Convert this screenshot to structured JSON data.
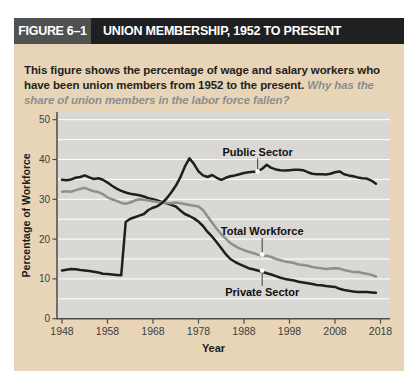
{
  "figure": {
    "label": "FIGURE 6–1",
    "title": "UNION MEMBERSHIP, 1952 TO PRESENT"
  },
  "caption": {
    "text": "This figure shows the percentage of wage and salary workers who have been union members from 1952 to the present.",
    "question": "Why has the share of union members in the labor force fallen?"
  },
  "colors": {
    "card_bg": "#e8d5b7",
    "header_label_bg": "#505153",
    "header_title_bg": "#202022",
    "header_text": "#ffffff",
    "panel_bg": "#d9d8d5",
    "gridline": "#ffffff",
    "axis": "#4b4c4e",
    "tick_label": "#3d3d3d",
    "axis_title": "#1c1c1c",
    "caption_text": "#231f20",
    "caption_question": "#8a8e90",
    "series_dark": "#1f1f20",
    "series_gray": "#8f8f8d",
    "annotation_text": "#101010",
    "leader": "#3a3a3a",
    "dot_fill": "#ffffff"
  },
  "chart_data": {
    "type": "line",
    "xlabel": "Year",
    "ylabel": "Percentage of Workforce",
    "xlim": [
      1947,
      2019
    ],
    "ylim": [
      0,
      50
    ],
    "x_ticks": [
      1948,
      1958,
      1968,
      1978,
      1988,
      1998,
      2008,
      2018
    ],
    "y_ticks": [
      0,
      10,
      20,
      30,
      40,
      50
    ],
    "grid_step": 5,
    "grid": "horizontal-white",
    "legend": "inline-labels",
    "series": [
      {
        "name": "Public Sector",
        "color_key": "series_dark",
        "points": [
          [
            1948,
            12.1
          ],
          [
            1949,
            12.3
          ],
          [
            1950,
            12.5
          ],
          [
            1951,
            12.4
          ],
          [
            1952,
            12.2
          ],
          [
            1953,
            12.1
          ],
          [
            1954,
            12.0
          ],
          [
            1955,
            11.8
          ],
          [
            1956,
            11.6
          ],
          [
            1957,
            11.3
          ],
          [
            1958,
            11.2
          ],
          [
            1959,
            11.1
          ],
          [
            1960,
            11.0
          ],
          [
            1961,
            10.9
          ],
          [
            1962,
            24.3
          ],
          [
            1963,
            25.1
          ],
          [
            1964,
            25.5
          ],
          [
            1965,
            25.9
          ],
          [
            1966,
            26.3
          ],
          [
            1967,
            27.3
          ],
          [
            1968,
            27.9
          ],
          [
            1969,
            28.3
          ],
          [
            1970,
            29.1
          ],
          [
            1971,
            30.2
          ],
          [
            1972,
            31.7
          ],
          [
            1973,
            33.4
          ],
          [
            1974,
            35.5
          ],
          [
            1975,
            38.2
          ],
          [
            1976,
            40.3
          ],
          [
            1977,
            38.9
          ],
          [
            1978,
            37.0
          ],
          [
            1979,
            36.0
          ],
          [
            1980,
            35.6
          ],
          [
            1981,
            36.1
          ],
          [
            1982,
            35.4
          ],
          [
            1983,
            34.9
          ],
          [
            1984,
            35.4
          ],
          [
            1985,
            35.8
          ],
          [
            1986,
            36.0
          ],
          [
            1987,
            36.3
          ],
          [
            1988,
            36.6
          ],
          [
            1989,
            36.8
          ],
          [
            1990,
            36.9
          ],
          [
            1991,
            37.0
          ],
          [
            1992,
            37.7
          ],
          [
            1993,
            38.7
          ],
          [
            1994,
            37.9
          ],
          [
            1995,
            37.5
          ],
          [
            1996,
            37.3
          ],
          [
            1997,
            37.2
          ],
          [
            1998,
            37.3
          ],
          [
            1999,
            37.4
          ],
          [
            2000,
            37.4
          ],
          [
            2001,
            37.3
          ],
          [
            2002,
            36.8
          ],
          [
            2003,
            36.4
          ],
          [
            2004,
            36.3
          ],
          [
            2005,
            36.3
          ],
          [
            2006,
            36.2
          ],
          [
            2007,
            36.4
          ],
          [
            2008,
            36.8
          ],
          [
            2009,
            37.0
          ],
          [
            2010,
            36.3
          ],
          [
            2011,
            36.0
          ],
          [
            2012,
            35.8
          ],
          [
            2013,
            35.5
          ],
          [
            2014,
            35.3
          ],
          [
            2015,
            35.2
          ],
          [
            2016,
            34.7
          ],
          [
            2017,
            33.9
          ]
        ]
      },
      {
        "name": "Total Workforce",
        "color_key": "series_gray",
        "points": [
          [
            1948,
            31.9
          ],
          [
            1949,
            32.0
          ],
          [
            1950,
            31.9
          ],
          [
            1951,
            32.3
          ],
          [
            1952,
            32.6
          ],
          [
            1953,
            32.9
          ],
          [
            1954,
            32.4
          ],
          [
            1955,
            32.0
          ],
          [
            1956,
            31.8
          ],
          [
            1957,
            31.3
          ],
          [
            1958,
            30.5
          ],
          [
            1959,
            30.0
          ],
          [
            1960,
            29.6
          ],
          [
            1961,
            29.1
          ],
          [
            1962,
            28.9
          ],
          [
            1963,
            29.2
          ],
          [
            1964,
            29.7
          ],
          [
            1965,
            30.0
          ],
          [
            1966,
            29.9
          ],
          [
            1967,
            29.7
          ],
          [
            1968,
            29.5
          ],
          [
            1969,
            29.3
          ],
          [
            1970,
            29.2
          ],
          [
            1971,
            29.1
          ],
          [
            1972,
            29.0
          ],
          [
            1973,
            29.2
          ],
          [
            1974,
            29.0
          ],
          [
            1975,
            28.8
          ],
          [
            1976,
            28.6
          ],
          [
            1977,
            28.4
          ],
          [
            1978,
            28.2
          ],
          [
            1979,
            27.3
          ],
          [
            1980,
            25.7
          ],
          [
            1981,
            24.1
          ],
          [
            1982,
            22.6
          ],
          [
            1983,
            21.2
          ],
          [
            1984,
            20.1
          ],
          [
            1985,
            19.0
          ],
          [
            1986,
            18.3
          ],
          [
            1987,
            17.7
          ],
          [
            1988,
            17.2
          ],
          [
            1989,
            16.8
          ],
          [
            1990,
            16.5
          ],
          [
            1991,
            16.1
          ],
          [
            1992,
            15.8
          ],
          [
            1993,
            15.8
          ],
          [
            1994,
            15.5
          ],
          [
            1995,
            15.0
          ],
          [
            1996,
            14.7
          ],
          [
            1997,
            14.4
          ],
          [
            1998,
            14.2
          ],
          [
            1999,
            14.0
          ],
          [
            2000,
            13.6
          ],
          [
            2001,
            13.5
          ],
          [
            2002,
            13.3
          ],
          [
            2003,
            13.0
          ],
          [
            2004,
            12.8
          ],
          [
            2005,
            12.7
          ],
          [
            2006,
            12.5
          ],
          [
            2007,
            12.6
          ],
          [
            2008,
            12.7
          ],
          [
            2009,
            12.6
          ],
          [
            2010,
            12.2
          ],
          [
            2011,
            12.0
          ],
          [
            2012,
            11.7
          ],
          [
            2013,
            11.7
          ],
          [
            2014,
            11.5
          ],
          [
            2015,
            11.3
          ],
          [
            2016,
            11.0
          ],
          [
            2017,
            10.6
          ]
        ]
      },
      {
        "name": "Private Sector",
        "color_key": "series_dark",
        "points": [
          [
            1948,
            34.9
          ],
          [
            1949,
            34.8
          ],
          [
            1950,
            35.0
          ],
          [
            1951,
            35.4
          ],
          [
            1952,
            35.6
          ],
          [
            1953,
            36.0
          ],
          [
            1954,
            35.5
          ],
          [
            1955,
            35.1
          ],
          [
            1956,
            35.3
          ],
          [
            1957,
            34.9
          ],
          [
            1958,
            34.2
          ],
          [
            1959,
            33.4
          ],
          [
            1960,
            32.7
          ],
          [
            1961,
            32.1
          ],
          [
            1962,
            31.7
          ],
          [
            1963,
            31.4
          ],
          [
            1964,
            31.2
          ],
          [
            1965,
            31.0
          ],
          [
            1966,
            30.7
          ],
          [
            1967,
            30.3
          ],
          [
            1968,
            30.0
          ],
          [
            1969,
            29.7
          ],
          [
            1970,
            29.3
          ],
          [
            1971,
            29.0
          ],
          [
            1972,
            28.6
          ],
          [
            1973,
            28.2
          ],
          [
            1974,
            27.2
          ],
          [
            1975,
            26.3
          ],
          [
            1976,
            25.8
          ],
          [
            1977,
            25.2
          ],
          [
            1978,
            24.4
          ],
          [
            1979,
            23.3
          ],
          [
            1980,
            21.8
          ],
          [
            1981,
            20.6
          ],
          [
            1982,
            19.2
          ],
          [
            1983,
            17.7
          ],
          [
            1984,
            16.2
          ],
          [
            1985,
            15.0
          ],
          [
            1986,
            14.3
          ],
          [
            1987,
            13.7
          ],
          [
            1988,
            13.2
          ],
          [
            1989,
            12.7
          ],
          [
            1990,
            12.4
          ],
          [
            1991,
            12.1
          ],
          [
            1992,
            11.8
          ],
          [
            1993,
            11.4
          ],
          [
            1994,
            11.1
          ],
          [
            1995,
            10.7
          ],
          [
            1996,
            10.3
          ],
          [
            1997,
            10.0
          ],
          [
            1998,
            9.8
          ],
          [
            1999,
            9.6
          ],
          [
            2000,
            9.3
          ],
          [
            2001,
            9.1
          ],
          [
            2002,
            8.9
          ],
          [
            2003,
            8.7
          ],
          [
            2004,
            8.5
          ],
          [
            2005,
            8.4
          ],
          [
            2006,
            8.2
          ],
          [
            2007,
            8.1
          ],
          [
            2008,
            8.0
          ],
          [
            2009,
            7.5
          ],
          [
            2010,
            7.2
          ],
          [
            2011,
            7.0
          ],
          [
            2012,
            6.8
          ],
          [
            2013,
            6.7
          ],
          [
            2014,
            6.7
          ],
          [
            2015,
            6.7
          ],
          [
            2016,
            6.6
          ],
          [
            2017,
            6.5
          ]
        ]
      }
    ],
    "annotations": [
      {
        "text": "Public Sector",
        "x": 1991,
        "y": 41.9,
        "dot_x": 1991,
        "dot_y": 37.0
      },
      {
        "text": "Total Workforce",
        "x": 1992,
        "y": 21.9,
        "dot_x": 1992,
        "dot_y": 16.1
      },
      {
        "text": "Private Sector",
        "x": 1992,
        "y": 6.6,
        "dot_x": 1992,
        "dot_y": 12.1
      }
    ]
  }
}
